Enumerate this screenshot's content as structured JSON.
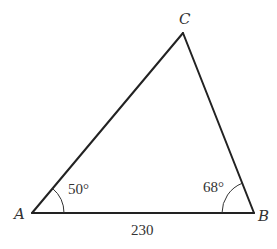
{
  "diagram": {
    "type": "triangle",
    "vertices": {
      "A": {
        "label": "A"
      },
      "B": {
        "label": "B"
      },
      "C": {
        "label": "C"
      }
    },
    "angles": {
      "A": {
        "label": "50°",
        "value": 50
      },
      "B": {
        "label": "68°",
        "value": 68
      }
    },
    "sides": {
      "AB": {
        "label": "230",
        "value": 230
      }
    }
  }
}
